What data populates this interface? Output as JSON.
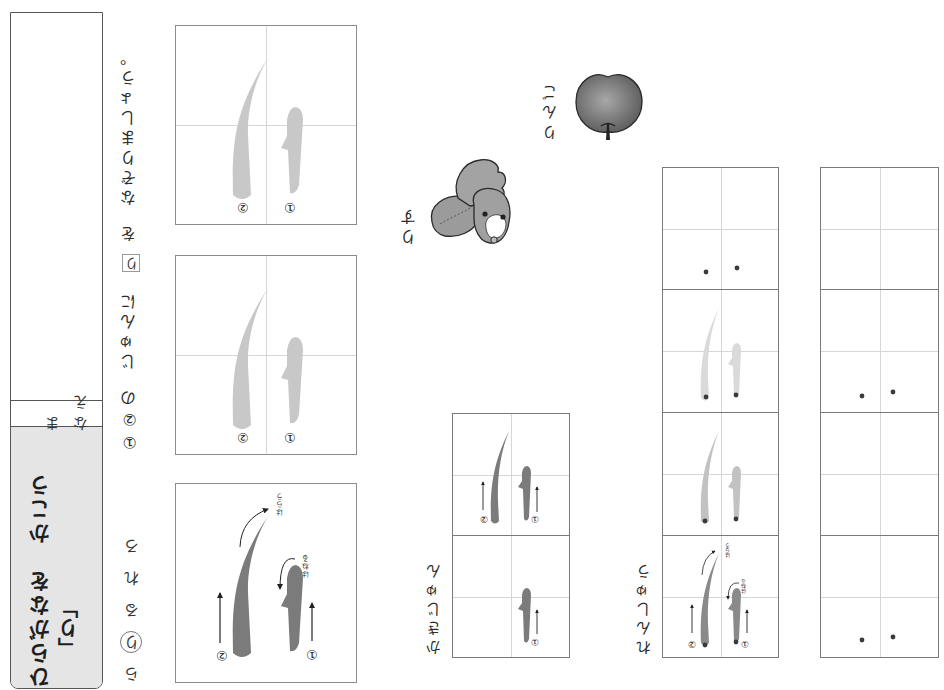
{
  "header": {
    "title": "ひらがなを　かこう",
    "target_char": "「り」",
    "name_label": "なまえ"
  },
  "row_guide": [
    {
      "char": "ら",
      "circled": false
    },
    {
      "char": "り",
      "circled": true
    },
    {
      "char": "る",
      "circled": false
    },
    {
      "char": "れ",
      "circled": false
    },
    {
      "char": "ろ",
      "circled": false
    }
  ],
  "instruction": {
    "order_marks": "①②の",
    "text_before": "じゅんに",
    "boxed_char": "り",
    "particle": "を",
    "text_after": "なぞりましょう。"
  },
  "tracing_boxes": [
    {
      "state": "model-with-arrows",
      "stroke_labels": [
        "①",
        "②"
      ],
      "notes": {
        "stroke_1": "はねる",
        "stroke_2": "はらう"
      }
    },
    {
      "state": "light-trace",
      "stroke_labels": [
        "①",
        "②"
      ]
    },
    {
      "state": "light-trace",
      "stroke_labels": [
        "①",
        "②"
      ]
    }
  ],
  "stroke_order": {
    "label": "かきじゅん",
    "steps": [
      {
        "stroke_labels": [
          "①",
          "②"
        ]
      },
      {
        "stroke_labels": [
          "①"
        ]
      }
    ]
  },
  "practice": {
    "label": "れんしゅう",
    "model": {
      "stroke_labels": [
        "①",
        "②"
      ],
      "notes": {
        "stroke_1": "はねる",
        "stroke_2": "はらう"
      }
    },
    "guided_row": [
      "model",
      "dark-trace",
      "light-trace",
      "start-dots"
    ],
    "free_row": [
      "start-dots",
      "empty",
      "start-dots",
      "empty"
    ]
  },
  "illustrations": [
    {
      "subject": "squirrel",
      "label": "りす"
    },
    {
      "subject": "apple",
      "label": "りんご"
    }
  ],
  "colors": {
    "title_panel_bg": "#e5e5e5",
    "model_stroke": "#7b7b7b",
    "trace_stroke": "#c8c8c8",
    "faint_trace_stroke": "#dadada",
    "box_border": "#8c8c8c",
    "guide_line": "#d6d6d6",
    "start_dot": "#3a3a3a"
  }
}
